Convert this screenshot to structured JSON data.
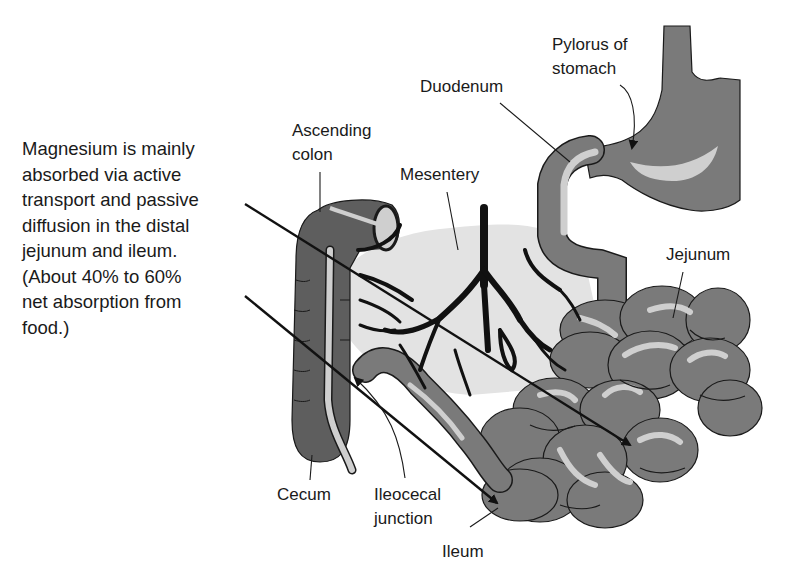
{
  "diagram": {
    "type": "anatomical-illustration",
    "description_lines": [
      "Magnesium is mainly",
      "absorbed via active",
      "transport and passive",
      "diffusion in the distal",
      "jejunum and ileum.",
      "(About 40% to 60%",
      "net absorption from",
      "food.)"
    ],
    "labels": {
      "pylorus_line1": "Pylorus of",
      "pylorus_line2": "stomach",
      "duodenum": "Duodenum",
      "ascending_colon_line1": "Ascending",
      "ascending_colon_line2": "colon",
      "mesentery": "Mesentery",
      "jejunum": "Jejunum",
      "cecum": "Cecum",
      "ileocecal_line1": "Ileocecal",
      "ileocecal_line2": "junction",
      "ileum": "Ileum"
    },
    "colors": {
      "organ_fill": "#7a7a7a",
      "colon_fill": "#5e5e5e",
      "highlight": "#cfcfcf",
      "mesentery_fill": "#e3e3e3",
      "vessel": "#111111",
      "outline": "#1a1a1a",
      "text": "#1a1a1a"
    }
  }
}
